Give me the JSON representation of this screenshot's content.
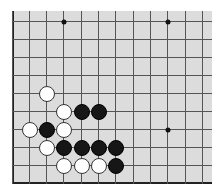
{
  "board": {
    "background": "#dcdcdc",
    "line_color": "#555555",
    "origin": {
      "x": 12,
      "y": 11
    },
    "x_lines": [
      0,
      17,
      34,
      51,
      69,
      86,
      103,
      121,
      138,
      155,
      173,
      190
    ],
    "y_lines": [
      10,
      28,
      46,
      64,
      82,
      100,
      118,
      136,
      154
    ],
    "star_points": [
      {
        "col": 3,
        "row": 0
      },
      {
        "col": 9,
        "row": 0
      },
      {
        "col": 9,
        "row": 6
      }
    ],
    "stones": [
      {
        "color": "white",
        "col": 2,
        "row": 4
      },
      {
        "color": "white",
        "col": 3,
        "row": 5
      },
      {
        "color": "black",
        "col": 4,
        "row": 5
      },
      {
        "color": "black",
        "col": 5,
        "row": 5
      },
      {
        "color": "white",
        "col": 1,
        "row": 6
      },
      {
        "color": "black",
        "col": 2,
        "row": 6
      },
      {
        "color": "white",
        "col": 3,
        "row": 6
      },
      {
        "color": "white",
        "col": 2,
        "row": 7
      },
      {
        "color": "black",
        "col": 3,
        "row": 7
      },
      {
        "color": "black",
        "col": 4,
        "row": 7
      },
      {
        "color": "black",
        "col": 5,
        "row": 7
      },
      {
        "color": "black",
        "col": 6,
        "row": 7
      },
      {
        "color": "white",
        "col": 3,
        "row": 8
      },
      {
        "color": "white",
        "col": 4,
        "row": 8
      },
      {
        "color": "white",
        "col": 5,
        "row": 8
      },
      {
        "color": "black",
        "col": 6,
        "row": 8
      }
    ]
  }
}
